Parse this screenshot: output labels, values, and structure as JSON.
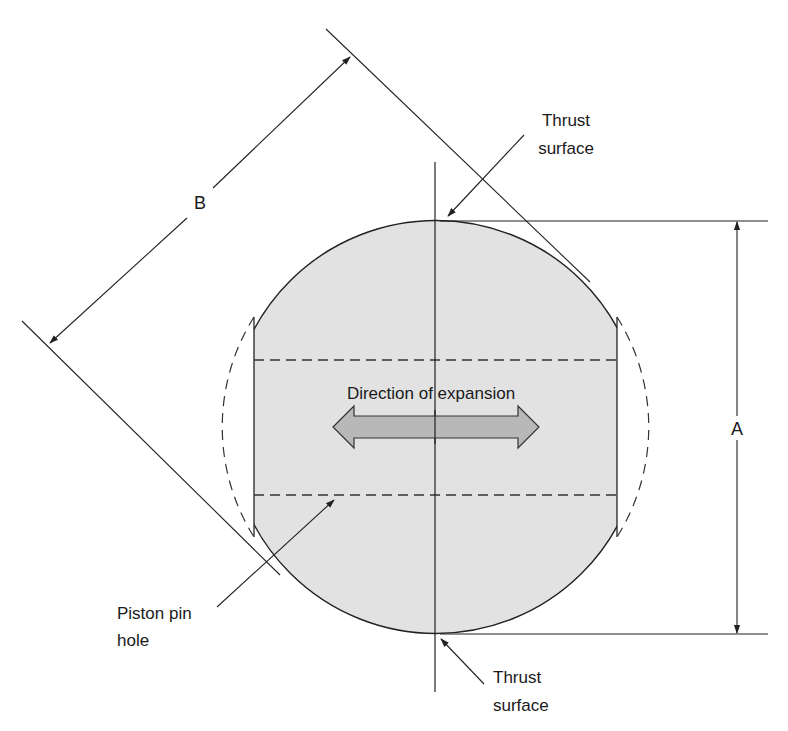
{
  "diagram": {
    "labels": {
      "thrust_top_line1": "Thrust",
      "thrust_top_line2": "surface",
      "thrust_bottom_line1": "Thrust",
      "thrust_bottom_line2": "surface",
      "direction": "Direction of expansion",
      "pin_line1": "Piston pin",
      "pin_line2": "hole",
      "dim_a": "A",
      "dim_b": "B"
    },
    "colors": {
      "fill": "#e2e2e2",
      "stroke": "#222222",
      "arrow_fill": "#b8b8b8",
      "background": "#ffffff"
    }
  }
}
